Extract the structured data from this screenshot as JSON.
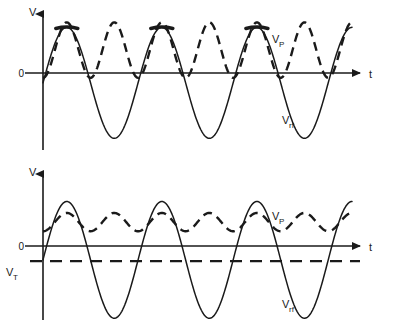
{
  "figure": {
    "title": "",
    "background": "#ffffff",
    "ink_color": "#1a1a1a"
  },
  "chart_data": [
    {
      "id": "upper",
      "type": "line",
      "title": "",
      "xlabel": "t",
      "ylabel": "V",
      "grid": false,
      "legend": "inline-annotations",
      "xlim": [
        0,
        3.25
      ],
      "ylim": [
        -1.3,
        1.15
      ],
      "axis_origin_label": "0",
      "annotations": [
        {
          "name": "vp-label",
          "text": "V",
          "sub": "P",
          "x": 2.22,
          "y": 0.62
        },
        {
          "name": "vrf-label",
          "text": "V",
          "sub": "rf",
          "x": 2.33,
          "y": -0.8
        }
      ],
      "series": [
        {
          "name": "V_rf",
          "label": "V",
          "sublabel": "rf",
          "style": "solid",
          "description": "rf drive sine wave, one full period per unit x, starting at zero and rising",
          "amplitude": 1.0,
          "offset": -0.09,
          "phase": 0.0,
          "periods": 3.25,
          "samples": 400
        },
        {
          "name": "V_P",
          "label": "V",
          "sublabel": "P",
          "style": "dashed",
          "description": "plasma potential, rectified double-frequency envelope riding the positive peaks, touching zero at minima",
          "amplitude": 0.5,
          "offset": 0.5,
          "phase": 0.0,
          "frequency_multiplier": 2.0,
          "samples": 400
        }
      ],
      "peak_caps": [
        {
          "x": 0.25,
          "y": 0.91
        },
        {
          "x": 1.25,
          "y": 0.91
        },
        {
          "x": 2.25,
          "y": 0.91
        }
      ]
    },
    {
      "id": "lower",
      "type": "line",
      "title": "",
      "xlabel": "t",
      "ylabel": "V",
      "grid": false,
      "legend": "inline-annotations",
      "xlim": [
        0,
        3.25
      ],
      "ylim": [
        -1.55,
        1.0
      ],
      "axis_origin_label": "0",
      "threshold": {
        "name": "V_T",
        "label": "V",
        "sublabel": "T",
        "value": -0.52,
        "style": "dashed"
      },
      "annotations": [
        {
          "name": "vp-label",
          "text": "V",
          "sub": "P",
          "x": 2.22,
          "y": 0.5
        },
        {
          "name": "vrf-label",
          "text": "V",
          "sub": "rf",
          "x": 2.33,
          "y": -1.12
        }
      ],
      "series": [
        {
          "name": "V_rf",
          "label": "V",
          "sublabel": "rf",
          "style": "solid",
          "description": "rf drive sine wave starting at threshold level V_T and rising",
          "amplitude": 1.02,
          "offset": -0.5,
          "phase": 0.0,
          "periods": 3.25,
          "samples": 400
        },
        {
          "name": "V_P",
          "label": "V",
          "sublabel": "P",
          "style": "dashed",
          "description": "plasma potential, small-amplitude rectified double-frequency ripple just above zero",
          "amplitude": 0.16,
          "offset": 0.16,
          "phase": 0.0,
          "frequency_multiplier": 2.0,
          "samples": 400
        }
      ],
      "peak_caps": []
    }
  ]
}
